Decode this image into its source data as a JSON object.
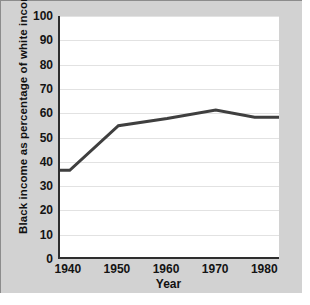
{
  "chart_data": {
    "type": "line",
    "title": "",
    "xlabel": "Year",
    "ylabel": "Black income as percentage of white income",
    "xlim": [
      1938,
      1983
    ],
    "ylim": [
      0,
      100
    ],
    "grid": true,
    "legend": false,
    "x_ticks": [
      "1940",
      "1950",
      "1960",
      "1970",
      "1980"
    ],
    "x_tick_values": [
      1940,
      1950,
      1960,
      1970,
      1980
    ],
    "y_ticks": [
      "0",
      "10",
      "20",
      "30",
      "40",
      "50",
      "60",
      "70",
      "80",
      "90",
      "100"
    ],
    "y_tick_values": [
      0,
      10,
      20,
      30,
      40,
      50,
      60,
      70,
      80,
      90,
      100
    ],
    "series": [
      {
        "name": "Black income as percentage of white income",
        "color": "#3f3f3f",
        "x": [
          1938,
          1940,
          1950,
          1960,
          1970,
          1978,
          1983
        ],
        "values": [
          36,
          36,
          54.5,
          57.5,
          61,
          58,
          58
        ]
      }
    ]
  },
  "axes": {
    "x_title": "Year",
    "y_title": "Black income as  percentage of white income"
  }
}
